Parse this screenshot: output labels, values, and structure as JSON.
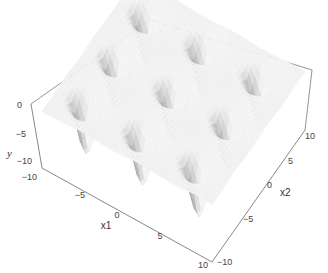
{
  "chart_data": {
    "type": "surface3d",
    "title": "",
    "axes": {
      "x1": {
        "label": "x1",
        "ticks": [
          -10,
          -5,
          0,
          5,
          10
        ],
        "range": [
          -10,
          10
        ]
      },
      "x2": {
        "label": "x2",
        "ticks": [
          -10,
          -5,
          0,
          5,
          10
        ],
        "range": [
          -10,
          10
        ]
      },
      "y": {
        "label": "y",
        "ticks": [
          0,
          -5,
          -10
        ],
        "range": [
          -12,
          2
        ]
      }
    },
    "grid": false,
    "box": true,
    "colormap": "grayscale-shaded",
    "legend": null
  },
  "labels": {
    "z_axis_label": "y",
    "x1_axis_label": "x1",
    "x2_axis_label": "x2",
    "z_ticks": [
      "0",
      "−5",
      "−10"
    ],
    "x1_ticks": [
      "−10",
      "−5",
      "0",
      "5",
      "10"
    ],
    "x2_ticks": [
      "−10",
      "−5",
      "0",
      "5",
      "10"
    ]
  },
  "colors": {
    "box": "#555555",
    "surface_light": "#f2f2f2",
    "surface_dark": "#4a4a4a",
    "text": "#444444"
  }
}
